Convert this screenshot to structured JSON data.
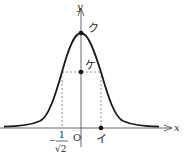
{
  "diagram": {
    "type": "function-graph",
    "curve": "bell-shaped curve symmetric about the y-axis",
    "axes": {
      "x_label": "x",
      "y_label": "y",
      "origin_label": "O"
    },
    "points": {
      "peak_label": "ク",
      "mid_label": "ケ",
      "x_point_label": "イ"
    },
    "x_tick": {
      "sign": "−",
      "numerator": "1",
      "denominator": "√2"
    },
    "colors": {
      "curve": "#1a1a1a",
      "axis": "#555555",
      "dashed": "#777777",
      "text": "#2a2a2a"
    }
  }
}
